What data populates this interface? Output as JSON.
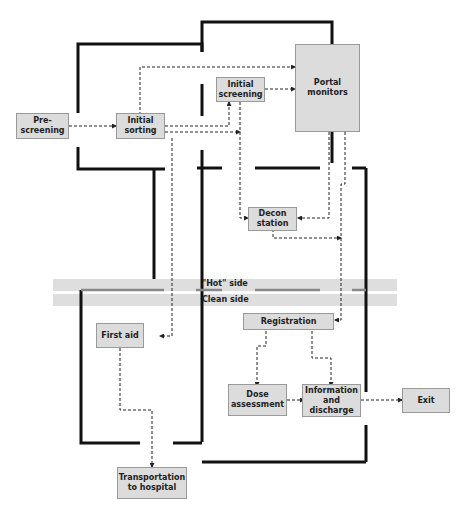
{
  "diagram": {
    "zones": {
      "hot_label": "\"Hot\" side",
      "clean_label": "Clean side"
    },
    "nodes": {
      "prescreening": "Pre-\nscreening",
      "initial_sorting": "Initial\nsorting",
      "initial_screening": "Initial\nscreening",
      "portal_monitors": "Portal\nmonitors",
      "decon_station": "Decon\nstation",
      "registration": "Registration",
      "first_aid": "First aid",
      "dose_assessment": "Dose\nassessment",
      "information_discharge": "Information\nand\ndischarge",
      "exit": "Exit",
      "transportation": "Transportation\nto hospital"
    },
    "edges": [
      [
        "Pre-screening",
        "Initial sorting"
      ],
      [
        "Initial sorting",
        "Initial screening"
      ],
      [
        "Initial sorting",
        "Portal monitors"
      ],
      [
        "Initial sorting",
        "Decon station"
      ],
      [
        "Initial sorting",
        "First aid"
      ],
      [
        "Initial screening",
        "Portal monitors"
      ],
      [
        "Initial screening",
        "Decon station"
      ],
      [
        "Portal monitors",
        "Decon station"
      ],
      [
        "Portal monitors",
        "Registration"
      ],
      [
        "Decon station",
        "Registration"
      ],
      [
        "Registration",
        "Dose assessment"
      ],
      [
        "Registration",
        "Information and discharge"
      ],
      [
        "Dose assessment",
        "Information and discharge"
      ],
      [
        "Information and discharge",
        "Exit"
      ],
      [
        "First aid",
        "Transportation to hospital"
      ]
    ]
  }
}
